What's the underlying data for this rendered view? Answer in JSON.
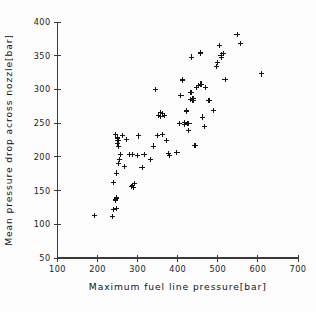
{
  "chart_data": {
    "type": "scatter",
    "title": "",
    "xlabel": "Maximum fuel line pressure[bar]",
    "ylabel": "Mean pressure drop across nozzle[bar]",
    "xlim": [
      100,
      700
    ],
    "ylim": [
      50,
      400
    ],
    "xticks": [
      100,
      200,
      300,
      400,
      500,
      600,
      700
    ],
    "yticks": [
      50,
      100,
      150,
      200,
      250,
      300,
      350,
      400
    ],
    "xtick_labels": [
      "100",
      "200",
      "300",
      "400",
      "500",
      "600",
      "700"
    ],
    "ytick_labels": [
      "50",
      "100",
      "150",
      "200",
      "250",
      "300",
      "350",
      "400"
    ],
    "grid": false,
    "legend": null,
    "marker": "plus",
    "marker_color": "#151515",
    "series": [
      {
        "name": "observations",
        "points": [
          [
            193,
            113
          ],
          [
            238,
            112
          ],
          [
            240,
            122
          ],
          [
            247,
            123
          ],
          [
            245,
            136
          ],
          [
            248,
            139
          ],
          [
            240,
            162
          ],
          [
            248,
            176
          ],
          [
            253,
            190
          ],
          [
            255,
            196
          ],
          [
            258,
            203
          ],
          [
            252,
            216
          ],
          [
            250,
            220
          ],
          [
            251,
            224
          ],
          [
            249,
            228
          ],
          [
            244,
            233
          ],
          [
            263,
            232
          ],
          [
            272,
            226
          ],
          [
            284,
            156
          ],
          [
            288,
            158
          ],
          [
            290,
            155
          ],
          [
            292,
            160
          ],
          [
            268,
            186
          ],
          [
            279,
            203
          ],
          [
            286,
            204
          ],
          [
            299,
            202
          ],
          [
            302,
            231
          ],
          [
            311,
            184
          ],
          [
            316,
            203
          ],
          [
            333,
            196
          ],
          [
            340,
            216
          ],
          [
            344,
            300
          ],
          [
            349,
            232
          ],
          [
            352,
            262
          ],
          [
            356,
            266
          ],
          [
            358,
            260
          ],
          [
            361,
            264
          ],
          [
            362,
            233
          ],
          [
            366,
            261
          ],
          [
            372,
            224
          ],
          [
            377,
            205
          ],
          [
            379,
            202
          ],
          [
            398,
            206
          ],
          [
            404,
            249
          ],
          [
            408,
            291
          ],
          [
            412,
            314
          ],
          [
            416,
            251
          ],
          [
            418,
            248
          ],
          [
            421,
            268
          ],
          [
            424,
            250
          ],
          [
            426,
            239
          ],
          [
            428,
            249
          ],
          [
            431,
            285
          ],
          [
            433,
            296
          ],
          [
            436,
            284
          ],
          [
            438,
            286
          ],
          [
            440,
            284
          ],
          [
            434,
            348
          ],
          [
            443,
            217
          ],
          [
            447,
            303
          ],
          [
            452,
            306
          ],
          [
            456,
            354
          ],
          [
            458,
            308
          ],
          [
            462,
            259
          ],
          [
            466,
            245
          ],
          [
            470,
            303
          ],
          [
            478,
            284
          ],
          [
            489,
            269
          ],
          [
            496,
            334
          ],
          [
            500,
            340
          ],
          [
            504,
            365
          ],
          [
            508,
            351
          ],
          [
            510,
            348
          ],
          [
            513,
            353
          ],
          [
            518,
            315
          ],
          [
            548,
            382
          ],
          [
            556,
            368
          ],
          [
            608,
            323
          ]
        ]
      }
    ]
  },
  "axes": {
    "xlabel": "Maximum fuel line pressure[bar]",
    "ylabel": "Mean pressure drop across nozzle[bar]"
  }
}
